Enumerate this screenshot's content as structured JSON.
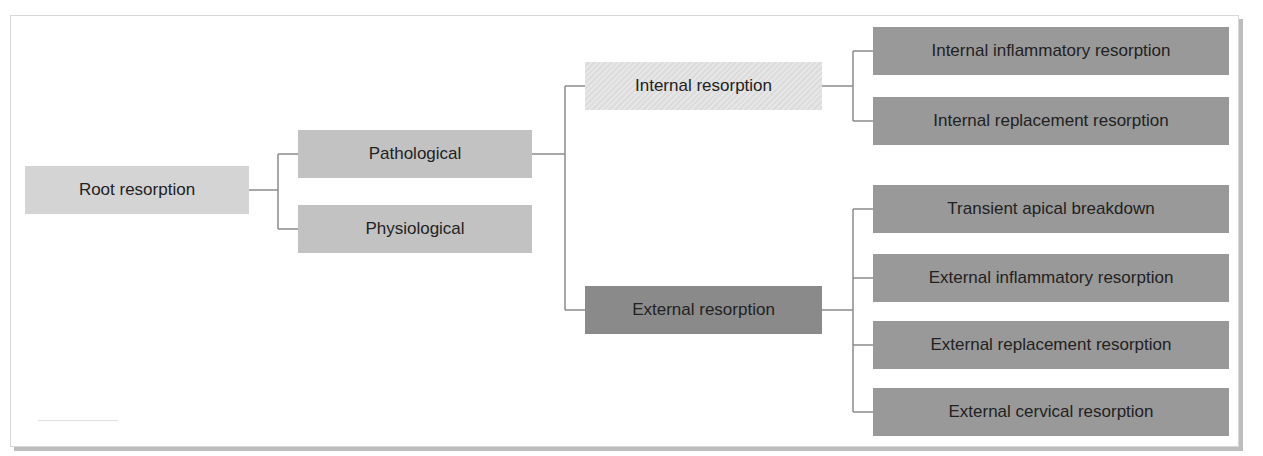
{
  "diagram": {
    "type": "tree",
    "colors": {
      "root": "#d4d4d4",
      "level1": "#c2c2c2",
      "internal": "#e2e2e2",
      "external": "#8a8a8a",
      "leaves": "#999999",
      "connector": "#8c8c8c"
    },
    "root": {
      "label": "Root resorption"
    },
    "level1": [
      {
        "label": "Pathological"
      },
      {
        "label": "Physiological"
      }
    ],
    "level2": [
      {
        "label": "Internal resorption"
      },
      {
        "label": "External resorption"
      }
    ],
    "internal_children": [
      {
        "label": "Internal inflammatory resorption"
      },
      {
        "label": "Internal replacement resorption"
      }
    ],
    "external_children": [
      {
        "label": "Transient apical breakdown"
      },
      {
        "label": "External inflammatory resorption"
      },
      {
        "label": "External replacement resorption"
      },
      {
        "label": "External cervical resorption"
      }
    ]
  }
}
